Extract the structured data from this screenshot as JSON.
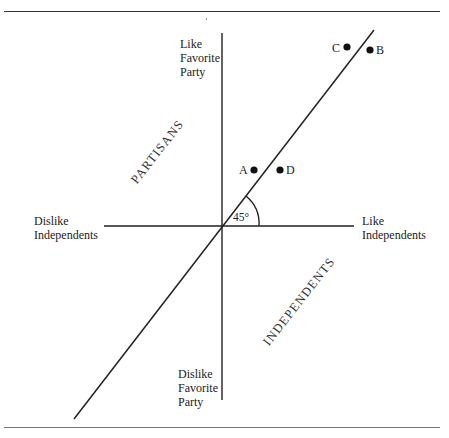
{
  "figure": {
    "top_rule": true,
    "bottom_rule": true
  },
  "axes": {
    "y_top_label": [
      "Like",
      "Favorite",
      "Party"
    ],
    "y_bottom_label": [
      "Dislike",
      "Favorite",
      "Party"
    ],
    "x_left_label": [
      "Dislike",
      "Independents"
    ],
    "x_right_label": [
      "Like",
      "Independents"
    ]
  },
  "regions": {
    "upper_left": "PARTISANS",
    "lower_right": "INDEPENDENTS"
  },
  "angle": {
    "label": "45°"
  },
  "points": [
    {
      "label": "C",
      "x": 347,
      "y": 47
    },
    {
      "label": "B",
      "x": 370,
      "y": 50
    },
    {
      "label": "A",
      "x": 254,
      "y": 170
    },
    {
      "label": "D",
      "x": 280,
      "y": 170
    }
  ],
  "colors": {
    "ink": "#1a1a1a",
    "background": "#ffffff"
  }
}
